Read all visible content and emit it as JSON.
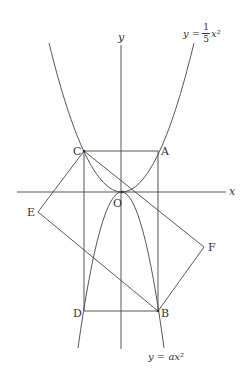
{
  "diagram": {
    "axes": {
      "x_label": "x",
      "y_label": "y",
      "origin_label": "O"
    },
    "points": {
      "A": "A",
      "B": "B",
      "C": "C",
      "D": "D",
      "E": "E",
      "F": "F"
    },
    "curves": {
      "upper": {
        "lhs": "y =",
        "num": "1",
        "den": "5",
        "rhs": "x²"
      },
      "lower": {
        "text": "y = ax²"
      }
    },
    "colors": {
      "stroke": "#444444",
      "background": "#ffffff"
    }
  }
}
